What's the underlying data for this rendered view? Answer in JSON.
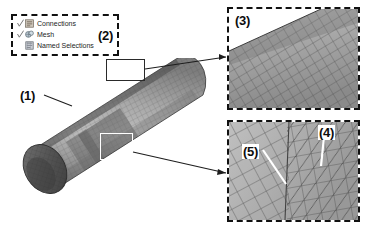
{
  "figure": {
    "caption_labels": {
      "l1": "(1)",
      "l2": "(2)",
      "l3": "(3)",
      "l4": "(4)",
      "l5": "(5)"
    }
  },
  "tree_box": {
    "label": "(2)",
    "items": [
      {
        "label": "Connections",
        "icon": "connections-icon",
        "checked": true
      },
      {
        "label": "Mesh",
        "icon": "mesh-icon",
        "checked": true
      },
      {
        "label": "Named Selections",
        "icon": "named-selections-icon",
        "checked": false
      }
    ]
  },
  "model": {
    "label": "(1)",
    "shape": "meshed-cylinder",
    "callouts": [
      {
        "name": "top-detail-region",
        "style": "dark-outline"
      },
      {
        "name": "bottom-detail-region",
        "style": "white-outline"
      }
    ]
  },
  "panels": [
    {
      "id": "panel-3",
      "label": "(3)",
      "content": "fine-quad-mesh-detail"
    },
    {
      "id": "panel-4",
      "label": "(4)",
      "secondary_label": "(5)",
      "content": "coarse-quad-and-triangle-mesh-detail"
    }
  ],
  "colors": {
    "outline": "#111111",
    "label_text": "#0d0d0d",
    "mesh_line": "#4a4a4a",
    "cylinder_light": "#b9b9b9",
    "cylinder_dark": "#5c5c5c",
    "white_callout": "#ffffff"
  }
}
